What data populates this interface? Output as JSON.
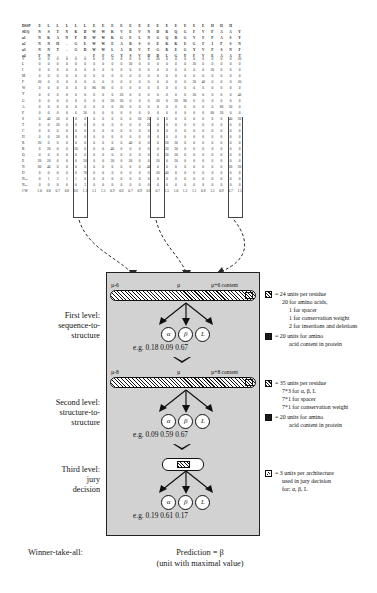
{
  "profile": {
    "row_labels": [
      "DSSP",
      "SEQ",
      "a1",
      "a2",
      "a3",
      "a4",
      "V",
      "L",
      "I",
      "M",
      "F",
      "W",
      "Y",
      "G",
      "A",
      "P",
      "S",
      "T",
      "C",
      "H",
      "R",
      "K",
      "Q",
      "E",
      "N",
      "D",
      "Nins",
      "Ndel",
      "CW"
    ],
    "rows": [
      [
        "DSSP",
        "E",
        "L",
        "L",
        "L",
        "L",
        "L",
        "E",
        "E",
        "E",
        "E",
        "E",
        "E",
        "E",
        "E",
        "E",
        "E",
        "E",
        "E",
        "E",
        "H",
        "H",
        "H"
      ],
      [
        "SEQ",
        "N",
        "S",
        "T",
        "N",
        "K",
        "D",
        "W",
        "W",
        "K",
        "V",
        "E",
        "V",
        "N",
        "D",
        "R",
        "Q",
        "G",
        "F",
        "V",
        "P",
        "A",
        "A",
        "Y"
      ],
      [
        "a1",
        "N",
        "K",
        "A",
        "N",
        "P",
        "D",
        "W",
        "W",
        "K",
        "G",
        "E",
        "L",
        "N",
        "G",
        "Q",
        "R",
        "G",
        "V",
        "F",
        "P",
        "A",
        "S",
        "Y"
      ],
      [
        "a2",
        "N",
        "N",
        "H",
        "-",
        "G",
        "E",
        "W",
        "W",
        "E",
        "A",
        "R",
        "S",
        "S",
        "E",
        "K",
        "K",
        "E",
        "G",
        "F",
        "I",
        "P",
        "S",
        "N"
      ],
      [
        "a3",
        "N",
        "N",
        "T",
        "-",
        "G",
        "D",
        "W",
        "W",
        "L",
        "A",
        "R",
        "V",
        "T",
        "G",
        "R",
        "E",
        "G",
        "Y",
        "V",
        "P",
        "S",
        "N",
        "F"
      ],
      [
        "a4",
        "F",
        "N",
        "-",
        "-",
        "-",
        "-",
        "F",
        "F",
        "G",
        "Y",
        "S",
        "V",
        "D",
        "D",
        "L",
        "G",
        "Y",
        "F",
        "V",
        "E",
        "A",
        "A",
        "T"
      ],
      [
        "V",
        "0",
        "0",
        "0",
        "0",
        "0",
        "0",
        "0",
        "0",
        "0",
        "0",
        "0",
        "0",
        "0",
        "20",
        "0",
        "0",
        "0",
        "0",
        "0",
        "0",
        "0",
        "0",
        "20"
      ],
      [
        "L",
        "0",
        "0",
        "0",
        "0",
        "0",
        "0",
        "0",
        "0",
        "0",
        "0",
        "20",
        "0",
        "0",
        "0",
        "0",
        "0",
        "0",
        "20",
        "0",
        "0",
        "0",
        "0",
        "0"
      ],
      [
        "I",
        "0",
        "0",
        "0",
        "0",
        "0",
        "0",
        "0",
        "0",
        "0",
        "0",
        "0",
        "0",
        "0",
        "0",
        "0",
        "0",
        "0",
        "0",
        "0",
        "20",
        "0",
        "0",
        "0"
      ],
      [
        "M",
        "0",
        "0",
        "0",
        "0",
        "0",
        "0",
        "0",
        "0",
        "0",
        "0",
        "0",
        "0",
        "0",
        "0",
        "0",
        "0",
        "0",
        "0",
        "0",
        "0",
        "0",
        "0",
        "0"
      ],
      [
        "F",
        "20",
        "0",
        "0",
        "0",
        "0",
        "0",
        "0",
        "0",
        "0",
        "0",
        "0",
        "0",
        "0",
        "0",
        "0",
        "0",
        "0",
        "20",
        "40",
        "0",
        "0",
        "0",
        "20"
      ],
      [
        "W",
        "0",
        "0",
        "0",
        "0",
        "0",
        "0",
        "80",
        "80",
        "0",
        "0",
        "0",
        "0",
        "0",
        "0",
        "0",
        "0",
        "0",
        "0",
        "0",
        "0",
        "0",
        "0",
        "0"
      ],
      [
        "Y",
        "0",
        "0",
        "0",
        "0",
        "0",
        "0",
        "0",
        "0",
        "0",
        "20",
        "0",
        "0",
        "0",
        "0",
        "0",
        "0",
        "0",
        "20",
        "0",
        "0",
        "0",
        "0",
        "40"
      ],
      [
        "G",
        "0",
        "0",
        "0",
        "0",
        "0",
        "0",
        "0",
        "0",
        "20",
        "20",
        "0",
        "0",
        "0",
        "20",
        "0",
        "20",
        "80",
        "0",
        "0",
        "0",
        "0",
        "0",
        "0"
      ],
      [
        "A",
        "0",
        "0",
        "0",
        "0",
        "0",
        "0",
        "0",
        "0",
        "0",
        "20",
        "0",
        "0",
        "0",
        "0",
        "0",
        "0",
        "0",
        "0",
        "0",
        "0",
        "80",
        "20",
        "0"
      ],
      [
        "P",
        "0",
        "0",
        "0",
        "0",
        "0",
        "20",
        "0",
        "0",
        "0",
        "0",
        "0",
        "0",
        "0",
        "0",
        "0",
        "0",
        "0",
        "0",
        "0",
        "80",
        "20",
        "0",
        "0"
      ],
      [
        "S",
        "0",
        "40",
        "20",
        "0",
        "0",
        "0",
        "0",
        "0",
        "0",
        "0",
        "0",
        "20",
        "20",
        "0",
        "0",
        "0",
        "0",
        "0",
        "0",
        "0",
        "0",
        "40",
        "20"
      ],
      [
        "T",
        "0",
        "0",
        "20",
        "0",
        "0",
        "0",
        "0",
        "0",
        "0",
        "0",
        "0",
        "0",
        "20",
        "0",
        "0",
        "0",
        "0",
        "0",
        "0",
        "0",
        "0",
        "0",
        "0"
      ],
      [
        "C",
        "0",
        "0",
        "0",
        "0",
        "0",
        "0",
        "0",
        "0",
        "0",
        "0",
        "0",
        "0",
        "0",
        "0",
        "0",
        "0",
        "0",
        "0",
        "0",
        "0",
        "0",
        "0",
        "0"
      ],
      [
        "H",
        "0",
        "0",
        "20",
        "0",
        "0",
        "0",
        "0",
        "0",
        "0",
        "0",
        "0",
        "0",
        "0",
        "0",
        "0",
        "0",
        "0",
        "0",
        "0",
        "0",
        "0",
        "0",
        "0"
      ],
      [
        "R",
        "20",
        "0",
        "0",
        "0",
        "0",
        "0",
        "0",
        "0",
        "0",
        "0",
        "40",
        "0",
        "0",
        "0",
        "20",
        "20",
        "0",
        "0",
        "0",
        "0",
        "0",
        "0",
        "0"
      ],
      [
        "K",
        "0",
        "20",
        "0",
        "0",
        "20",
        "0",
        "0",
        "0",
        "40",
        "0",
        "0",
        "0",
        "0",
        "0",
        "20",
        "20",
        "0",
        "0",
        "0",
        "0",
        "0",
        "0",
        "0"
      ],
      [
        "Q",
        "0",
        "0",
        "0",
        "0",
        "0",
        "0",
        "0",
        "0",
        "0",
        "0",
        "0",
        "0",
        "0",
        "0",
        "20",
        "20",
        "0",
        "0",
        "0",
        "0",
        "0",
        "0",
        "0"
      ],
      [
        "E",
        "20",
        "20",
        "0",
        "0",
        "0",
        "20",
        "0",
        "0",
        "20",
        "0",
        "20",
        "0",
        "0",
        "20",
        "0",
        "20",
        "0",
        "0",
        "0",
        "0",
        "0",
        "0",
        "0"
      ],
      [
        "N",
        "60",
        "40",
        "0",
        "0",
        "0",
        "0",
        "0",
        "0",
        "0",
        "0",
        "0",
        "0",
        "40",
        "0",
        "0",
        "0",
        "0",
        "0",
        "0",
        "0",
        "0",
        "20",
        "20"
      ],
      [
        "D",
        "0",
        "0",
        "0",
        "0",
        "0",
        "70",
        "0",
        "0",
        "0",
        "0",
        "0",
        "0",
        "0",
        "20",
        "40",
        "0",
        "0",
        "0",
        "0",
        "0",
        "0",
        "0",
        "0"
      ],
      [
        "Nins",
        "0",
        "1",
        "3",
        "1",
        "1",
        "0",
        "0",
        "0",
        "0",
        "0",
        "0",
        "0",
        "0",
        "0",
        "0",
        "0",
        "0",
        "0",
        "0",
        "0",
        "0",
        "0",
        "0"
      ],
      [
        "Ndel",
        "0",
        "0",
        "0",
        "0",
        "0",
        "3",
        "0",
        "0",
        "0",
        "0",
        "0",
        "0",
        "0",
        "0",
        "0",
        "0",
        "0",
        "0",
        "0",
        "0",
        "0",
        "0",
        "0"
      ],
      [
        "CW",
        "1.0",
        "0.8",
        "0.7",
        "0.8",
        "0.6",
        "1.1",
        "1.1",
        "1.5",
        "0.9",
        "0.6",
        "0.7",
        "0.9",
        "0.8",
        "0.7",
        "1.5",
        "1.0",
        "1.2",
        "1.1",
        "0.8",
        "1.5",
        "0.9",
        "0.7",
        "1.5"
      ]
    ]
  },
  "levels": {
    "first": {
      "label_line1": "First level:",
      "label_line2": "sequence-to-",
      "label_line3": "structure",
      "bar_left": "µ-6",
      "bar_center": "µ",
      "bar_right": "µ+6  content",
      "nodes": [
        "α",
        "β",
        "L"
      ],
      "eg_prefix": "e.g.",
      "eg_values": [
        "0.18",
        "0.09",
        "0.67"
      ]
    },
    "second": {
      "label_line1": "Second level:",
      "label_line2": "structure-to-",
      "label_line3": "structure",
      "bar_left": "µ-8",
      "bar_center": "µ",
      "bar_right": "µ+8  content",
      "nodes": [
        "α",
        "β",
        "L"
      ],
      "eg_prefix": "e.g.",
      "eg_values": [
        "0.09",
        "0.59",
        "0.67"
      ]
    },
    "third": {
      "label_line1": "Third level:",
      "label_line2": "jury",
      "label_line3": "decision",
      "nodes": [
        "α",
        "β",
        "L"
      ],
      "eg_prefix": "e.g.",
      "eg_values": [
        "0.19",
        "0.61",
        "0.17"
      ]
    }
  },
  "legend": {
    "block1": {
      "symbol": "hatched-square-icon",
      "lines": [
        "= 24 units per residue",
        "20 for amino acids,",
        "1 for spacer",
        "1 for conservation weight",
        "2 for insertions and deletions"
      ]
    },
    "block1b": {
      "symbol": "solid-square-icon",
      "lines": [
        "= 20 units for amino",
        "acid content in protein"
      ]
    },
    "block2": {
      "symbol": "hatched-square-icon",
      "lines": [
        "= 35 units per residue",
        "7*3 for α, β, L",
        "7*1 for spacer",
        "7*1 for conservation weight"
      ]
    },
    "block2b": {
      "symbol": "solid-square-icon",
      "lines": [
        "= 20 units for amino",
        "acid content in protein"
      ]
    },
    "block3": {
      "symbol": "jury-square-icon",
      "lines": [
        "= 3 units per architecture",
        "used in jury decision",
        "for: α, β, L"
      ]
    }
  },
  "caption": {
    "winner": "Winner-take-all:",
    "prediction": "Prediction = β",
    "note": "(unit with maximal value)"
  }
}
